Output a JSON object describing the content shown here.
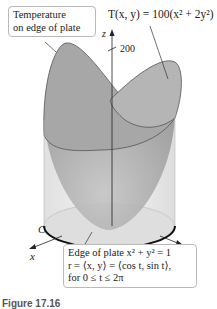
{
  "figure": {
    "surface_equation": "T(x, y) = 100(x² + 2y²)",
    "axes": {
      "z_label": "z",
      "x_label": "x",
      "y_label": "y",
      "z_tick": "200"
    },
    "curve_label": "C",
    "callouts": {
      "temperature": [
        "Temperature",
        "on edge of plate"
      ],
      "edge": [
        "Edge of plate x² + y² = 1",
        "r = ⟨x, y⟩ = ⟨cos t, sin t⟩,",
        "for 0 ≤ t ≤ 2π"
      ]
    },
    "caption": "Figure 17.16",
    "colors": {
      "surface_dark": "#a9a9a9",
      "surface_light": "#c8c8c8",
      "cylinder": "#e9e9e9",
      "plate": "#dcdcdc",
      "outline": "#222222"
    }
  }
}
